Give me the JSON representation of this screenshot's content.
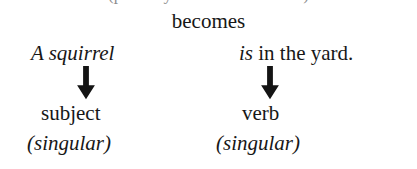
{
  "page": {
    "background_color": "#ffffff",
    "text_color": "#171717"
  },
  "clipped_top_line": {
    "text": "(partially cut off line of text)"
  },
  "transition": {
    "label": "becomes"
  },
  "columns": [
    {
      "id": "subject-column",
      "phrase_italic": "A squirrel",
      "phrase_roman": "",
      "arrow": "down-arrow",
      "role_label": "subject",
      "number_label": "(singular)"
    },
    {
      "id": "verb-column",
      "phrase_italic": "is",
      "phrase_roman": " in the yard.",
      "arrow": "down-arrow",
      "role_label": "verb",
      "number_label": "(singular)"
    }
  ]
}
